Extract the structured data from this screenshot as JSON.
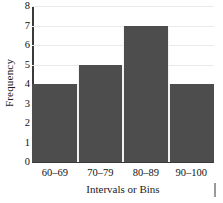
{
  "chart_data": {
    "type": "bar",
    "title": "",
    "categories": [
      "60–69",
      "70–79",
      "80–89",
      "90–100"
    ],
    "values": [
      4,
      5,
      7,
      4
    ],
    "xlabel": "Intervals or Bins",
    "ylabel": "Frequency",
    "ylim": [
      0,
      8
    ],
    "ytick_labels": [
      "8",
      "7",
      "6",
      "5",
      "4",
      "3",
      "2",
      "1",
      "0"
    ],
    "ytick_values": [
      8,
      7,
      6,
      5,
      4,
      3,
      2,
      1,
      0
    ],
    "ytick_step": 1,
    "grid": "horizontal",
    "legend": "none",
    "bar_color": "#4d4d4d",
    "gridline_color": "#e9e9e9",
    "axis_color": "#3a3a3a",
    "text_color": "#111111"
  }
}
